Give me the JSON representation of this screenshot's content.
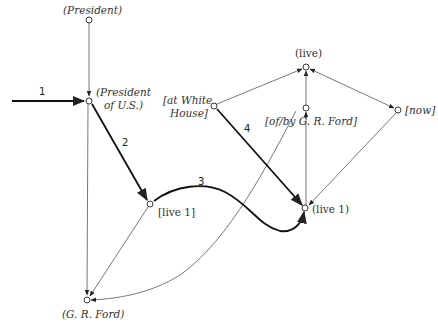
{
  "diagram": {
    "type": "semantic-network",
    "nodes": [
      {
        "id": "president",
        "label": "(President)",
        "style": "italic"
      },
      {
        "id": "president_us",
        "label_line1": "(President",
        "label_line2": "of U.S.)",
        "style": "italic"
      },
      {
        "id": "live1_left",
        "label": "[live 1]",
        "style": "roman"
      },
      {
        "id": "gr_ford",
        "label": "(G. R. Ford)",
        "style": "italic"
      },
      {
        "id": "live",
        "label": "(live)",
        "style": "roman"
      },
      {
        "id": "at_white_house",
        "label_line1": "[at White",
        "label_line2": "House]",
        "style": "italic"
      },
      {
        "id": "of_by_ford",
        "label": "[of/by G. R. Ford]",
        "style": "italic"
      },
      {
        "id": "now",
        "label": "[now]",
        "style": "italic"
      },
      {
        "id": "live1_right",
        "label": "(live 1)",
        "style": "roman"
      }
    ],
    "path_labels": {
      "step1": "1",
      "step2": "2",
      "step3": "3",
      "step4": "4"
    },
    "edges": [
      {
        "from": "president",
        "to": "president_us",
        "weight": "thin"
      },
      {
        "from": "input",
        "to": "president_us",
        "weight": "bold",
        "label": "1"
      },
      {
        "from": "president_us",
        "to": "live1_left",
        "weight": "bold",
        "label": "2"
      },
      {
        "from": "president_us",
        "to": "gr_ford",
        "weight": "thin"
      },
      {
        "from": "live1_left",
        "to": "gr_ford",
        "weight": "thin"
      },
      {
        "from": "live1_left",
        "to": "live1_right",
        "weight": "bold",
        "label": "3",
        "shape": "curve"
      },
      {
        "from": "at_white_house",
        "to": "live1_right",
        "weight": "bold",
        "label": "4"
      },
      {
        "from": "at_white_house",
        "to": "live",
        "weight": "thin"
      },
      {
        "from": "of_by_ford",
        "to": "live",
        "weight": "thin"
      },
      {
        "from": "live",
        "to": "now",
        "weight": "thin",
        "bidirectional": true
      },
      {
        "from": "live1_right",
        "to": "of_by_ford",
        "weight": "thin"
      },
      {
        "from": "now",
        "to": "live1_right",
        "weight": "thin"
      },
      {
        "from": "of_by_ford",
        "to": "gr_ford",
        "weight": "thin",
        "shape": "curve"
      }
    ]
  }
}
